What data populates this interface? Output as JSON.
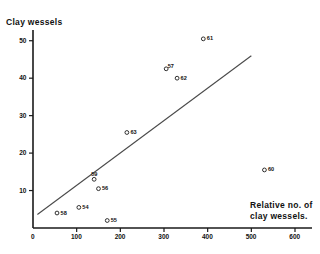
{
  "chart_data": {
    "type": "scatter",
    "title": "",
    "ylabel": "Clay wessels",
    "xlabel": "Relative no. of clay wessels.",
    "xlabel_line1": "Relative no. of",
    "xlabel_line2": "clay wessels.",
    "xlim": [
      0,
      600
    ],
    "ylim": [
      0,
      55
    ],
    "grid": false,
    "legend": false,
    "xticks": [
      0,
      100,
      200,
      300,
      400,
      500,
      600
    ],
    "xtick_labels": [
      "0",
      "100",
      "200",
      "300",
      "400",
      "500",
      "600"
    ],
    "yticks": [
      10,
      20,
      30,
      40,
      50
    ],
    "ytick_labels": [
      "10",
      "20",
      "30",
      "40",
      "50"
    ],
    "marker": "open-circle",
    "points": [
      {
        "label": "61",
        "x": 390,
        "y": 50.5
      },
      {
        "label": "57",
        "x": 305,
        "y": 42.5
      },
      {
        "label": "62",
        "x": 330,
        "y": 40.0
      },
      {
        "label": "63",
        "x": 215,
        "y": 25.5
      },
      {
        "label": "60",
        "x": 530,
        "y": 15.5
      },
      {
        "label": "59",
        "x": 140,
        "y": 13.0
      },
      {
        "label": "56",
        "x": 150,
        "y": 10.5
      },
      {
        "label": "54",
        "x": 105,
        "y": 5.5
      },
      {
        "label": "58",
        "x": 55,
        "y": 4.0
      },
      {
        "label": "55",
        "x": 170,
        "y": 2.0
      }
    ],
    "trend_line": {
      "name": "regression-line",
      "x_start": 10,
      "y_start": 3.6,
      "x_end": 500,
      "y_end": 46.0
    },
    "colors": {
      "axis": "#1a1a1a",
      "marker": "#1a1a1a",
      "line": "#4a4a4a",
      "background": "#ffffff"
    }
  }
}
